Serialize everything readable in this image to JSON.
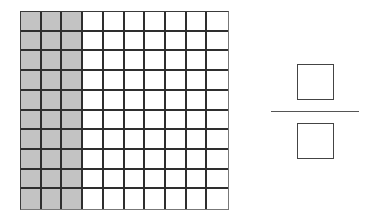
{
  "grid": {
    "rows": 10,
    "columns": 10,
    "shaded_columns": 3,
    "shaded_color": "#c3c3c3",
    "line_color": "#2e2e2e"
  },
  "fraction": {
    "numerator": "",
    "denominator": ""
  }
}
